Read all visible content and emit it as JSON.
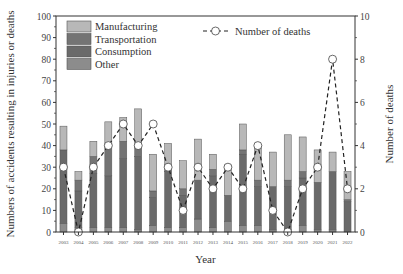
{
  "chart_data": {
    "type": "bar",
    "subtype": "stacked bar with line overlay (dual axis)",
    "title": "",
    "xlabel": "Year",
    "ylabel": "Numbers of accidents resulting in injuries or deaths",
    "y2label": "Number of deaths",
    "ylim": [
      0,
      100
    ],
    "y2lim": [
      0,
      10
    ],
    "yticks": [
      0,
      10,
      20,
      30,
      40,
      50,
      60,
      70,
      80,
      90,
      100
    ],
    "y2ticks": [
      0,
      2,
      4,
      6,
      8,
      10
    ],
    "categories": [
      "2003",
      "2004",
      "2005",
      "2006",
      "2007",
      "2008",
      "2009",
      "2010",
      "2011",
      "2012",
      "2013",
      "2014",
      "2015",
      "2016",
      "2017",
      "2018",
      "2019",
      "2020",
      "2021",
      "2022"
    ],
    "series": [
      {
        "name": "Other",
        "color": "#8c8c8c",
        "values": [
          4,
          2,
          2,
          2,
          2,
          1,
          3,
          2,
          2,
          6,
          2,
          5,
          3,
          3,
          1,
          1,
          3,
          1,
          1,
          0
        ]
      },
      {
        "name": "Consumption",
        "color": "#6a6a6a",
        "values": [
          34,
          17,
          25,
          24,
          32,
          34,
          13,
          26,
          15,
          18,
          24,
          12,
          33,
          18,
          20,
          20,
          22,
          22,
          27,
          14
        ]
      },
      {
        "name": "Transportation",
        "color": "#747474",
        "values": [
          0,
          5,
          8,
          15,
          8,
          4,
          3,
          3,
          3,
          0,
          3,
          0,
          2,
          3,
          0,
          3,
          3,
          0,
          0,
          1
        ]
      },
      {
        "name": "Manufacturing",
        "color": "#b8b8b8",
        "values": [
          11,
          4,
          7,
          10,
          11,
          18,
          17,
          10,
          13,
          19,
          7,
          14,
          12,
          16,
          16,
          21,
          16,
          15,
          9,
          13
        ]
      }
    ],
    "totals": [
      49,
      28,
      42,
      51,
      53,
      57,
      36,
      41,
      33,
      43,
      36,
      31,
      50,
      40,
      37,
      45,
      44,
      38,
      37,
      28
    ],
    "line_series": {
      "name": "Number of deaths",
      "axis": "right",
      "style": "dashed with open circle markers",
      "values": [
        3,
        0,
        3,
        4,
        5,
        4,
        5,
        3,
        1,
        3,
        2,
        3,
        2,
        4,
        1,
        0,
        2,
        3,
        8,
        2
      ]
    },
    "legend": {
      "bars": [
        "Manufacturing",
        "Transportation",
        "Consumption",
        "Other"
      ],
      "line": "Number of deaths",
      "position": "top-left (bars), top-right (line)"
    },
    "grid": false
  }
}
